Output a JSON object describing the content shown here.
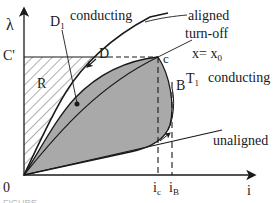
{
  "figure": {
    "type": "flux-linkage vs current diagram (switched reluctance machine energy conversion loop)",
    "axes": {
      "y_label": "λ",
      "x_label": "i",
      "origin_label": "0"
    },
    "labels": {
      "c_prime": "C'",
      "r_region": "R",
      "d1": "D",
      "d1_sub": "1",
      "d": "D",
      "c": "c",
      "b": "B",
      "t1": "T",
      "t1_sub": "1",
      "ic": "i",
      "ic_sub": "c",
      "ib": "i",
      "ib_sub": "B"
    },
    "annotations": {
      "conducting_top": "conducting",
      "aligned": "aligned",
      "turn_off": "turn-off",
      "x_eq": "x= x",
      "x_eq_sub": "0",
      "conducting_right": "conducting",
      "unaligned": "unaligned"
    },
    "caption_partial": "FIGURE ...",
    "colors": {
      "line": "#1a1a1a",
      "shaded_region": "#a9a9a9",
      "hatch": "#333333",
      "background": "#ffffff"
    }
  }
}
